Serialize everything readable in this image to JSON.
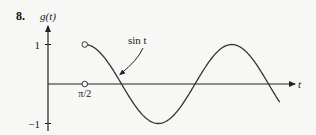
{
  "problem_number": "8.",
  "chart_data": {
    "type": "line",
    "title": "",
    "xlabel": "t",
    "ylabel": "g(t)",
    "ylim": [
      -1,
      1
    ],
    "xlim": [
      0,
      9.9
    ],
    "x_ticks": [
      {
        "value": 1.5708,
        "label": "π/2"
      }
    ],
    "y_ticks": [
      {
        "value": 1,
        "label": "1"
      },
      {
        "value": -1,
        "label": "-1"
      }
    ],
    "grid": false,
    "legend": "none",
    "series": [
      {
        "name": "sin t",
        "function": "sin",
        "domain": [
          1.5708,
          9.9
        ],
        "sample_points": [
          {
            "x": 1.5708,
            "y": 1
          },
          {
            "x": 3.1416,
            "y": 0
          },
          {
            "x": 4.7124,
            "y": -1
          },
          {
            "x": 6.2832,
            "y": 0
          },
          {
            "x": 7.854,
            "y": 1
          },
          {
            "x": 9.4248,
            "y": 0
          },
          {
            "x": 9.9,
            "y": -0.46
          }
        ]
      }
    ],
    "open_points": [
      {
        "x": 1.5708,
        "y": 1
      },
      {
        "x": 1.5708,
        "y": 0
      }
    ],
    "annotations": [
      {
        "text": "sin t",
        "points_to": {
          "x": 2.9,
          "y": 0.6
        }
      }
    ]
  }
}
